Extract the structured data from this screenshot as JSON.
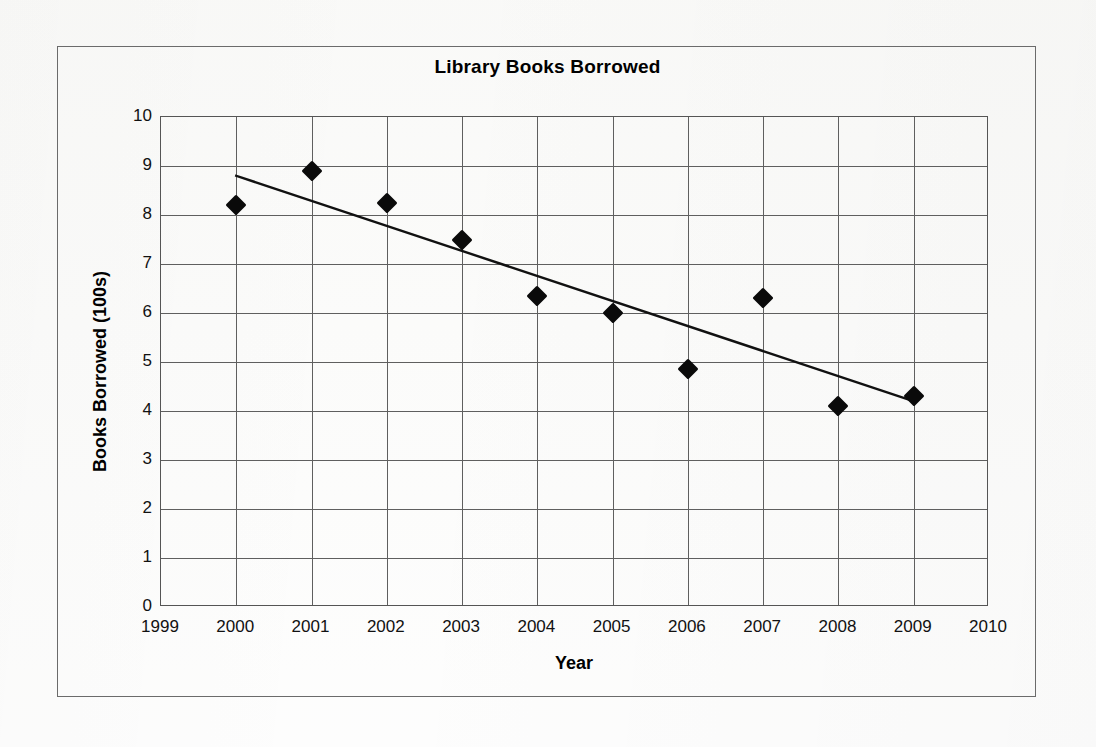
{
  "chart_data": {
    "type": "scatter",
    "title": "Library Books Borrowed",
    "xlabel": "Year",
    "ylabel": "Books Borrowed  (100s)",
    "x": [
      2000,
      2001,
      2002,
      2003,
      2004,
      2005,
      2006,
      2007,
      2008,
      2009
    ],
    "values": [
      8.2,
      8.9,
      8.25,
      7.5,
      6.35,
      6.0,
      4.85,
      6.3,
      4.1,
      4.3
    ],
    "series": [
      {
        "name": "Books Borrowed",
        "marker": "diamond",
        "color": "#0a0a0a",
        "points": [
          {
            "x": 2000,
            "y": 8.2
          },
          {
            "x": 2001,
            "y": 8.9
          },
          {
            "x": 2002,
            "y": 8.25
          },
          {
            "x": 2003,
            "y": 7.5
          },
          {
            "x": 2004,
            "y": 6.35
          },
          {
            "x": 2005,
            "y": 6.0
          },
          {
            "x": 2006,
            "y": 4.85
          },
          {
            "x": 2007,
            "y": 6.3
          },
          {
            "x": 2008,
            "y": 4.1
          },
          {
            "x": 2009,
            "y": 4.3
          }
        ]
      }
    ],
    "trendline": {
      "name": "line of best fit",
      "color": "#111111",
      "start": {
        "x": 2000,
        "y": 8.8
      },
      "end": {
        "x": 2009,
        "y": 4.2
      }
    },
    "xlim": [
      1999,
      2010
    ],
    "ylim": [
      0,
      10
    ],
    "xticks": [
      1999,
      2000,
      2001,
      2002,
      2003,
      2004,
      2005,
      2006,
      2007,
      2008,
      2009,
      2010
    ],
    "yticks": [
      0,
      1,
      2,
      3,
      4,
      5,
      6,
      7,
      8,
      9,
      10
    ],
    "xtick_labels": [
      "1999",
      "2000",
      "2001",
      "2002",
      "2003",
      "2004",
      "2005",
      "2006",
      "2007",
      "2008",
      "2009",
      "2010"
    ],
    "ytick_labels": [
      "0",
      "1",
      "2",
      "3",
      "4",
      "5",
      "6",
      "7",
      "8",
      "9",
      "10"
    ],
    "grid": true,
    "legend": false,
    "legend_position": "none"
  },
  "colors": {
    "frame_border": "#6b6b6b",
    "grid": "#5f5f5f",
    "marker": "#0a0a0a",
    "trendline": "#111111",
    "background": "#fbfbfa",
    "text": "#000000"
  }
}
